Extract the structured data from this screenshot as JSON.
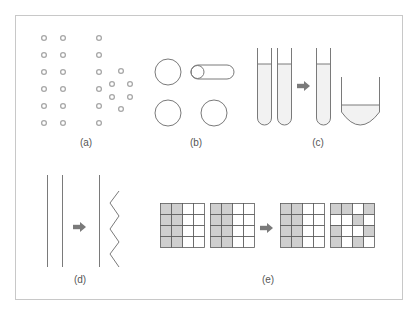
{
  "colors": {
    "frame": "#c8c8c8",
    "stroke": "#8a8a8a",
    "dot": "#a8a8a8",
    "arrow": "#7a7a7a",
    "fill_gray": "#cfcfcf",
    "liquid": "#f2f2f2"
  },
  "panels": [
    {
      "id": "a",
      "label": "(a)",
      "label_x": 86,
      "label_y": 137,
      "description": "two columns of dots plus column with hexagonal dot cluster"
    },
    {
      "id": "b",
      "label": "(b)",
      "label_x": 196,
      "label_y": 137,
      "description": "circles and a capsule shape"
    },
    {
      "id": "c",
      "label": "(c)",
      "label_x": 318,
      "label_y": 137,
      "description": "two test tubes -> one test tube and a beaker"
    },
    {
      "id": "d",
      "label": "(d)",
      "label_x": 80,
      "label_y": 274,
      "description": "parallel lines -> line and zigzag"
    },
    {
      "id": "e",
      "label": "(e)",
      "label_x": 268,
      "label_y": 274,
      "description": "4x4 grids shaded patterns transformation"
    }
  ],
  "grids": [
    {
      "x": 160,
      "y": 203,
      "pattern": [
        [
          1,
          1,
          0,
          0
        ],
        [
          1,
          1,
          0,
          0
        ],
        [
          1,
          1,
          0,
          0
        ],
        [
          1,
          1,
          0,
          0
        ]
      ]
    },
    {
      "x": 210,
      "y": 203,
      "pattern": [
        [
          1,
          1,
          0,
          0
        ],
        [
          1,
          1,
          0,
          0
        ],
        [
          1,
          1,
          0,
          0
        ],
        [
          1,
          1,
          0,
          0
        ]
      ]
    },
    {
      "x": 280,
      "y": 203,
      "pattern": [
        [
          1,
          1,
          0,
          0
        ],
        [
          1,
          1,
          0,
          0
        ],
        [
          1,
          1,
          0,
          0
        ],
        [
          1,
          1,
          0,
          0
        ]
      ]
    },
    {
      "x": 330,
      "y": 203,
      "pattern": [
        [
          1,
          1,
          0,
          1
        ],
        [
          0,
          0,
          1,
          0
        ],
        [
          1,
          0,
          0,
          1
        ],
        [
          1,
          0,
          1,
          0
        ]
      ]
    }
  ]
}
